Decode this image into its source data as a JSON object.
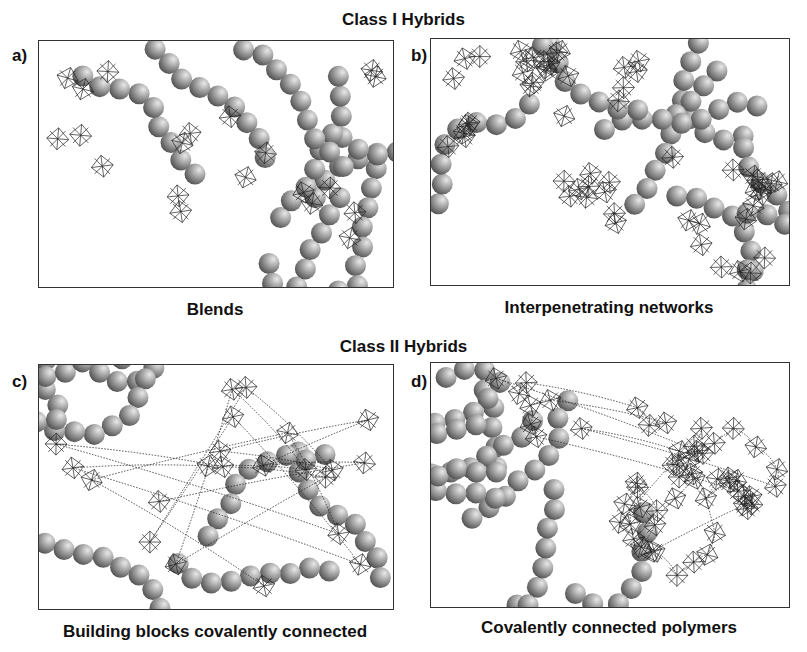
{
  "figure": {
    "class1_title": "Class I Hybrids",
    "class2_title": "Class II Hybrids",
    "panels": [
      {
        "letter": "a)",
        "caption": "Blends",
        "type": "blend"
      },
      {
        "letter": "b)",
        "caption": "Interpenetrating networks",
        "type": "ipn"
      },
      {
        "letter": "c)",
        "caption": "Building blocks covalently connected",
        "type": "blocks"
      },
      {
        "letter": "d)",
        "caption": "Covalently connected polymers",
        "type": "polymers"
      }
    ],
    "legend_elements": {
      "sphere": "organic-polymer-sphere",
      "octahedron": "inorganic-octahedron-cluster",
      "link": "covalent-linker-zigzag"
    },
    "colors": {
      "sphere_light": "#e8e8e8",
      "sphere_dark": "#555555",
      "line": "#222222",
      "border": "#333333"
    }
  }
}
